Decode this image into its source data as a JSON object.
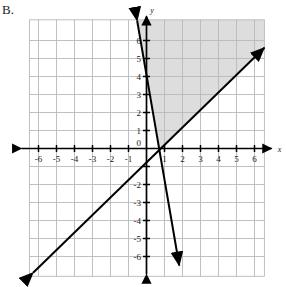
{
  "problem": {
    "label": "B."
  },
  "chart_data": {
    "type": "line",
    "title": "",
    "xlabel": "x",
    "ylabel": "y",
    "grid": true,
    "legend": "none",
    "xlim": [
      -7,
      7
    ],
    "ylim": [
      -7,
      7
    ],
    "x_ticks": [
      "-6",
      "-5",
      "-4",
      "-3",
      "-2",
      "-1",
      "1",
      "2",
      "3",
      "4",
      "5",
      "6"
    ],
    "x_tick_values": [
      -6,
      -5,
      -4,
      -3,
      -2,
      -1,
      1,
      2,
      3,
      4,
      5,
      6
    ],
    "y_ticks": [
      "6",
      "5",
      "4",
      "3",
      "2",
      "1",
      "-2",
      "-3",
      "-4",
      "-5",
      "-6"
    ],
    "y_tick_values": [
      6,
      5,
      4,
      3,
      2,
      1,
      -2,
      -3,
      -4,
      -5,
      -6
    ],
    "origin_label": "0",
    "series": [
      {
        "name": "steep-line",
        "slope": -5.8,
        "intercept": 4.1,
        "x_start": -0.52,
        "y_start": 7.1,
        "x_end": 1.82,
        "y_end": -6.5,
        "arrow_start": true,
        "arrow_end": true,
        "style": "solid",
        "color": "#000000"
      },
      {
        "name": "shallow-line",
        "slope": 0.98,
        "intercept": -0.8,
        "x_start": -6.3,
        "y_start": -6.9,
        "x_end": 6.55,
        "y_end": 5.6,
        "arrow_start": true,
        "arrow_end": true,
        "style": "solid",
        "color": "#000000"
      }
    ],
    "shaded_region": {
      "name": "solution-region",
      "description": "region above the steep line and above the shallow line",
      "fill": "#c8c8c8",
      "opacity": 0.62
    }
  },
  "colors": {
    "grid": "#b9b9b9",
    "grid_minor": "#d8d8d8",
    "axis": "#000000",
    "line": "#000000",
    "shade": "#c8c8c8",
    "background": "#ffffff"
  }
}
